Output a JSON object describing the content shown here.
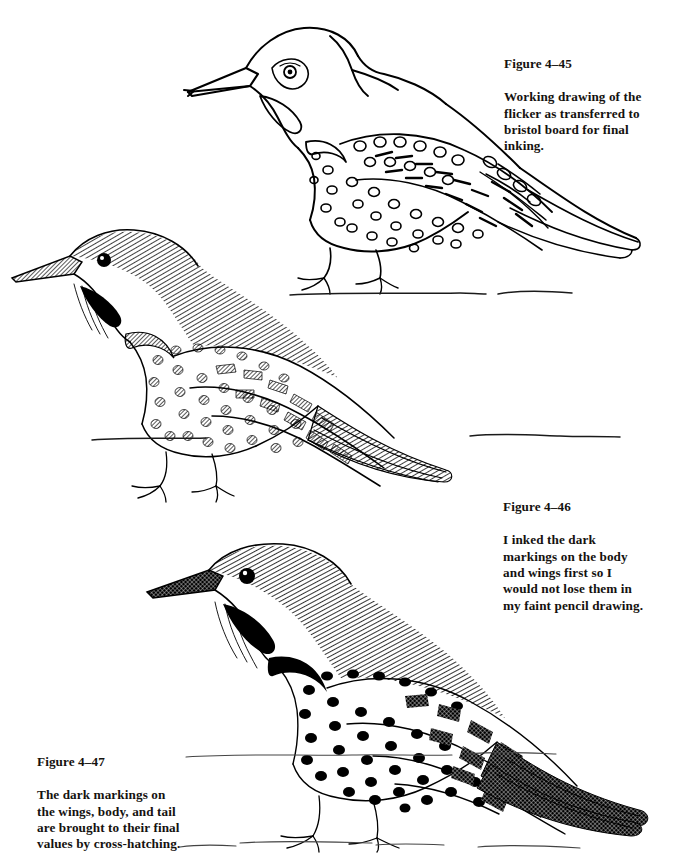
{
  "page": {
    "background_color": "#ffffff",
    "ink_color": "#000000",
    "text_color": "#15120f",
    "width": 687,
    "height": 866
  },
  "figures": [
    {
      "id": "4-45",
      "label": "Figure 4–45",
      "caption": "Working drawing of the\nflicker as transferred to\nbristol board for final\ninking.",
      "subject": "flicker bird, left-facing, perched",
      "stage": "pencil working drawing transferred to bristol board",
      "rendering": "outline only, open unfilled spots and bars, no tonal shading",
      "caption_position": "right of illustration"
    },
    {
      "id": "4-46",
      "label": "Figure 4–46",
      "caption": "I inked the dark\nmarkings on the body\nand wings first so I\nwould not lose them in\nmy faint pencil drawing.",
      "subject": "flicker bird, left-facing, perched",
      "stage": "dark markings inked first",
      "rendering": "crown and back fine line hatching, solid black eye and malar stripe, stippled body spots, hatched wing bars and tail",
      "caption_position": "right of illustration"
    },
    {
      "id": "4-47",
      "label": "Figure 4–47",
      "caption": "The dark markings on\nthe wings, body, and tail\nare brought to their final\nvalues by cross-hatching.",
      "subject": "flicker bird, left-facing, perched",
      "stage": "final values by cross-hatching",
      "rendering": "solid black body spots, dense black cross-hatched tail and wing tips, crescent breast patch filled",
      "caption_position": "left of illustration"
    }
  ],
  "ground_lines": {
    "count": 4,
    "style": "hand drawn broken horizontal lines",
    "description": "perch or ground indication beneath each bird"
  }
}
